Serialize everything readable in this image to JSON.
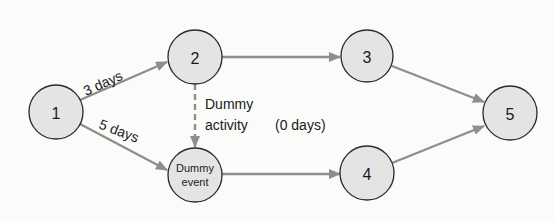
{
  "diagram": {
    "type": "activity-on-arrow network",
    "colors": {
      "node_fill": "#e4e4e4",
      "node_stroke": "#2a2a2a",
      "edge": "#8e8e8e",
      "text": "#1a1a1a"
    },
    "nodes": [
      {
        "id": "1",
        "label": "1"
      },
      {
        "id": "2",
        "label": "2"
      },
      {
        "id": "dummy",
        "label_line1": "Dummy",
        "label_line2": "event"
      },
      {
        "id": "3",
        "label": "3"
      },
      {
        "id": "4",
        "label": "4"
      },
      {
        "id": "5",
        "label": "5"
      }
    ],
    "edges": [
      {
        "from": "1",
        "to": "2",
        "label": "3 days"
      },
      {
        "from": "1",
        "to": "dummy",
        "label": "5 days"
      },
      {
        "from": "2",
        "to": "dummy",
        "label_line1": "Dummy",
        "label_line2": "activity",
        "duration": "(0 days)",
        "style": "dashed"
      },
      {
        "from": "2",
        "to": "3",
        "label": ""
      },
      {
        "from": "dummy",
        "to": "4",
        "label": ""
      },
      {
        "from": "3",
        "to": "5",
        "label": ""
      },
      {
        "from": "4",
        "to": "5",
        "label": ""
      }
    ]
  }
}
